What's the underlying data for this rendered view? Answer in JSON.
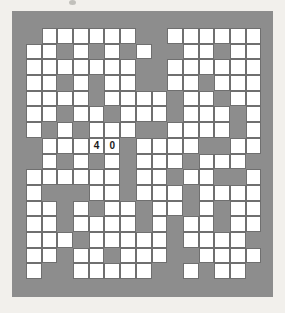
{
  "page": {
    "background_color": "#f2f0ec",
    "top_mark": "page-dot"
  },
  "puzzle": {
    "type": "crossword-grid",
    "board_color": "#8d8d8d",
    "cell_fill_color": "#ffffff",
    "cell_border_color": "#6f6f6f",
    "entered_text_color": "#1b1b1b",
    "columns": 15,
    "rows": 16,
    "entries": [
      {
        "row": 7,
        "col": 4,
        "value": "4"
      },
      {
        "row": 7,
        "col": 5,
        "value": "0"
      },
      {
        "row": 7,
        "col": 6,
        "value": "7"
      }
    ],
    "entered_answer": "407",
    "layout": [
      "011111100111111",
      "110101010011011",
      "111111100111111",
      "110101100110111",
      "111101111011011",
      "110110111011101",
      "101011100111101",
      "011111011110011",
      "010101011101110",
      "111111011011001",
      "100011011101111",
      "110101101101011",
      "110111101011011",
      "111011111011110",
      "110110111001111",
      "100111110010110"
    ]
  }
}
